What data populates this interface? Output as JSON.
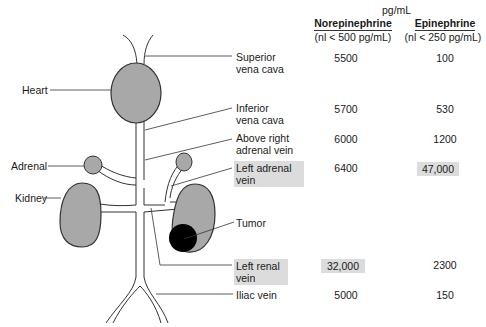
{
  "header": {
    "unit": "pg/mL",
    "columns": [
      {
        "name": "Norepinephrine",
        "normal": "(nl < 500 pg/mL)"
      },
      {
        "name": "Epinephrine",
        "normal": "(nl < 250 pg/mL)"
      }
    ]
  },
  "left_labels": {
    "heart": "Heart",
    "adrenal": "Adrenal",
    "kidney": "Kidney"
  },
  "rows": [
    {
      "site": "Superior\nvena cava",
      "norepinephrine": "5500",
      "epinephrine": "100",
      "highlight_site": false,
      "highlight_ne": false,
      "highlight_epi": false
    },
    {
      "site": "Inferior\nvena cava",
      "norepinephrine": "5700",
      "epinephrine": "530",
      "highlight_site": false,
      "highlight_ne": false,
      "highlight_epi": false
    },
    {
      "site": "Above right\nadrenal vein",
      "norepinephrine": "6000",
      "epinephrine": "1200",
      "highlight_site": false,
      "highlight_ne": false,
      "highlight_epi": false
    },
    {
      "site": "Left adrenal\nvein",
      "norepinephrine": "6400",
      "epinephrine": "47,000",
      "highlight_site": true,
      "highlight_ne": false,
      "highlight_epi": true
    },
    {
      "site": "Tumor",
      "norepinephrine": "",
      "epinephrine": "",
      "highlight_site": false,
      "highlight_ne": false,
      "highlight_epi": false
    },
    {
      "site": "Left renal\nvein",
      "norepinephrine": "32,000",
      "epinephrine": "2300",
      "highlight_site": true,
      "highlight_ne": true,
      "highlight_epi": false
    },
    {
      "site": "Iliac vein",
      "norepinephrine": "5000",
      "epinephrine": "150",
      "highlight_site": false,
      "highlight_ne": false,
      "highlight_epi": false
    }
  ],
  "colors": {
    "organ_fill": "#a8a8a8",
    "tumor_fill": "#000000",
    "highlight": "#dcdcdc",
    "line": "#333333"
  }
}
